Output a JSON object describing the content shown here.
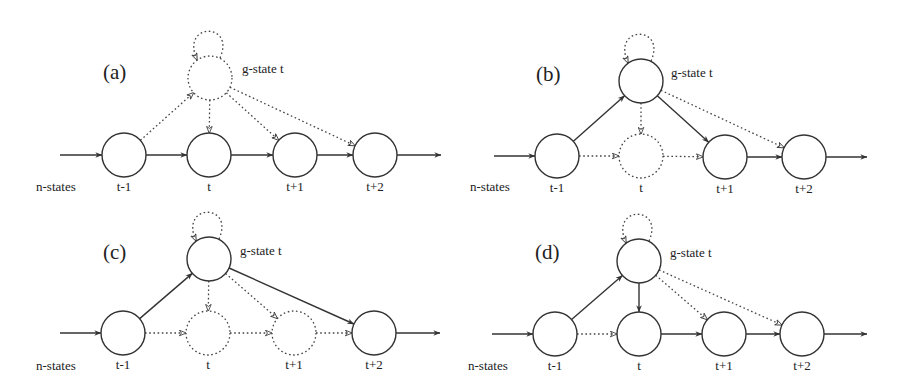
{
  "figure": {
    "node_radius": 22,
    "colors": {
      "stroke": "#333333",
      "background": "#ffffff",
      "text": "#222222"
    },
    "common_labels": {
      "input_label": "n-states",
      "g_state_label": "g-state t",
      "node_labels": [
        "t-1",
        "t",
        "t+1",
        "t+2"
      ]
    },
    "panels": [
      {
        "id": "a",
        "label": "(a)",
        "label_pos": [
          103,
          79
        ],
        "g_state": {
          "x": 210,
          "y": 78,
          "style": "dotted",
          "self_loop": "dotted"
        },
        "g_label_pos": [
          242,
          73
        ],
        "input_label_pos": [
          36,
          191
        ],
        "nodes": [
          {
            "label": "t-1",
            "x": 124,
            "y": 155,
            "style": "solid"
          },
          {
            "label": "t",
            "x": 209,
            "y": 155,
            "style": "solid"
          },
          {
            "label": "t+1",
            "x": 295,
            "y": 155,
            "style": "solid"
          },
          {
            "label": "t+2",
            "x": 375,
            "y": 155,
            "style": "solid"
          }
        ],
        "input_arrow": {
          "from": 60,
          "style": "solid"
        },
        "output_arrow": {
          "to": 441,
          "style": "solid"
        },
        "chain_edges": [
          "solid",
          "solid",
          "solid"
        ],
        "g_edges": {
          "from_t-1": "dotted",
          "to_t": "dotted",
          "to_t+1": "dotted",
          "to_t+2": "dotted"
        }
      },
      {
        "id": "b",
        "label": "(b)",
        "label_pos": [
          536,
          81
        ],
        "g_state": {
          "x": 641,
          "y": 81,
          "style": "solid",
          "self_loop": "dotted"
        },
        "g_label_pos": [
          671,
          77
        ],
        "input_label_pos": [
          470,
          191
        ],
        "nodes": [
          {
            "label": "t-1",
            "x": 557,
            "y": 156,
            "style": "solid"
          },
          {
            "label": "t",
            "x": 641,
            "y": 156,
            "style": "dotted"
          },
          {
            "label": "t+1",
            "x": 725,
            "y": 157,
            "style": "solid"
          },
          {
            "label": "t+2",
            "x": 804,
            "y": 157,
            "style": "solid"
          }
        ],
        "input_arrow": {
          "from": 494,
          "style": "solid"
        },
        "output_arrow": {
          "to": 867,
          "style": "solid"
        },
        "chain_edges": [
          "dotted",
          "dotted",
          "solid"
        ],
        "g_edges": {
          "from_t-1": "solid",
          "to_t": "dotted",
          "to_t+1": "solid",
          "to_t+2": "dotted"
        }
      },
      {
        "id": "c",
        "label": "(c)",
        "label_pos": [
          103,
          259
        ],
        "g_state": {
          "x": 209,
          "y": 259,
          "style": "solid",
          "self_loop": "dotted"
        },
        "g_label_pos": [
          240,
          255
        ],
        "input_label_pos": [
          36,
          370
        ],
        "nodes": [
          {
            "label": "t-1",
            "x": 123,
            "y": 333,
            "style": "solid"
          },
          {
            "label": "t",
            "x": 208,
            "y": 333,
            "style": "dotted"
          },
          {
            "label": "t+1",
            "x": 294,
            "y": 333,
            "style": "dotted"
          },
          {
            "label": "t+2",
            "x": 374,
            "y": 333,
            "style": "solid"
          }
        ],
        "input_arrow": {
          "from": 60,
          "style": "solid"
        },
        "output_arrow": {
          "to": 440,
          "style": "solid"
        },
        "chain_edges": [
          "dotted",
          "dotted",
          "dotted"
        ],
        "g_edges": {
          "from_t-1": "solid",
          "to_t": "dotted",
          "to_t+1": "dotted",
          "to_t+2": "solid"
        }
      },
      {
        "id": "d",
        "label": "(d)",
        "label_pos": [
          535,
          259
        ],
        "g_state": {
          "x": 639,
          "y": 261,
          "style": "solid",
          "self_loop": "dotted"
        },
        "g_label_pos": [
          670,
          257
        ],
        "input_label_pos": [
          468,
          370
        ],
        "nodes": [
          {
            "label": "t-1",
            "x": 555,
            "y": 334,
            "style": "solid"
          },
          {
            "label": "t",
            "x": 639,
            "y": 334,
            "style": "solid"
          },
          {
            "label": "t+1",
            "x": 724,
            "y": 334,
            "style": "solid"
          },
          {
            "label": "t+2",
            "x": 802,
            "y": 334,
            "style": "solid"
          }
        ],
        "input_arrow": {
          "from": 492,
          "style": "solid"
        },
        "output_arrow": {
          "to": 867,
          "style": "solid"
        },
        "chain_edges": [
          "dotted",
          "solid",
          "solid"
        ],
        "g_edges": {
          "from_t-1": "solid",
          "to_t": "solid",
          "to_t+1": "dotted",
          "to_t+2": "dotted"
        }
      }
    ]
  }
}
